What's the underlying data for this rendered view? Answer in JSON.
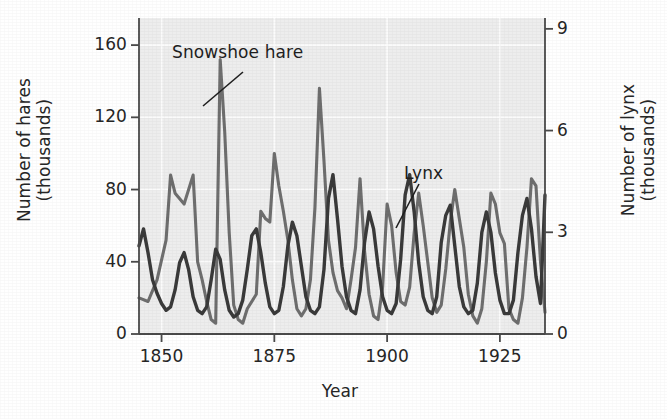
{
  "figure": {
    "background_color": "#ffffff",
    "plot_background_color": "#ededed"
  },
  "annotations": [
    {
      "name": "snowshoe-hare",
      "text": "Snowshoe hare"
    },
    {
      "name": "lynx",
      "text": "Lynx"
    }
  ],
  "annotation_labels": {
    "hare": "Snowshoe hare",
    "lynx": "Lynx"
  },
  "chart_data": {
    "type": "line",
    "title": "",
    "subtitle": "",
    "xlabel": "Year",
    "ylabel": "Number of hares\n(thousands)",
    "ylabel_right": "Number of lynx\n(thousands)",
    "xlim": [
      1845,
      1935
    ],
    "ylim": [
      0,
      175
    ],
    "ylim_right": [
      0,
      9.32
    ],
    "xticks": [
      1850,
      1875,
      1900,
      1925
    ],
    "xticklabels": [
      "1850",
      "1875",
      "1900",
      "1925"
    ],
    "yticks": [
      0,
      40,
      80,
      120,
      160
    ],
    "yticklabels": [
      "0",
      "40",
      "80",
      "120",
      "160"
    ],
    "yticks_right": [
      0,
      3,
      6,
      9
    ],
    "yticklabels_right": [
      "0",
      "3",
      "6",
      "9"
    ],
    "grid": true,
    "legend": "annotated-inline",
    "legend_position": "inline-callouts",
    "series": [
      {
        "name": "Snowshoe hare",
        "axis": "left",
        "units": "thousands of hares",
        "color": "#6e6e6e",
        "linewidth": 3.1,
        "x": [
          1845,
          1847,
          1849,
          1851,
          1852,
          1853,
          1855,
          1857,
          1858,
          1859,
          1860,
          1861,
          1862,
          1863,
          1864,
          1865,
          1866,
          1867,
          1868,
          1869,
          1871,
          1872,
          1873,
          1874,
          1875,
          1876,
          1877,
          1878,
          1879,
          1880,
          1881,
          1882,
          1883,
          1884,
          1885,
          1886,
          1887,
          1888,
          1889,
          1890,
          1891,
          1892,
          1893,
          1894,
          1895,
          1896,
          1897,
          1898,
          1899,
          1900,
          1901,
          1902,
          1903,
          1904,
          1905,
          1906,
          1907,
          1908,
          1909,
          1910,
          1911,
          1912,
          1913,
          1914,
          1915,
          1916,
          1917,
          1918,
          1919,
          1920,
          1921,
          1922,
          1923,
          1924,
          1925,
          1926,
          1927,
          1928,
          1929,
          1930,
          1931,
          1932,
          1933,
          1934,
          1935
        ],
        "y": [
          20,
          18,
          30,
          52,
          88,
          78,
          72,
          88,
          40,
          30,
          18,
          8,
          6,
          152,
          112,
          56,
          16,
          8,
          6,
          14,
          22,
          68,
          64,
          62,
          100,
          82,
          68,
          52,
          30,
          14,
          10,
          14,
          30,
          70,
          136,
          96,
          52,
          34,
          24,
          20,
          14,
          30,
          48,
          86,
          46,
          22,
          10,
          8,
          26,
          72,
          60,
          34,
          18,
          16,
          26,
          56,
          78,
          60,
          40,
          20,
          12,
          16,
          36,
          62,
          80,
          64,
          48,
          22,
          10,
          6,
          14,
          40,
          78,
          72,
          56,
          50,
          14,
          8,
          6,
          20,
          48,
          86,
          82,
          40,
          12
        ]
      },
      {
        "name": "Lynx",
        "axis": "right",
        "units": "thousands of lynx",
        "color": "#3a3a3a",
        "linewidth": 3.4,
        "x": [
          1845,
          1846,
          1847,
          1848,
          1849,
          1850,
          1851,
          1852,
          1853,
          1854,
          1855,
          1856,
          1857,
          1858,
          1859,
          1860,
          1861,
          1862,
          1863,
          1864,
          1865,
          1866,
          1867,
          1868,
          1869,
          1870,
          1871,
          1872,
          1873,
          1874,
          1875,
          1876,
          1877,
          1878,
          1879,
          1880,
          1881,
          1882,
          1883,
          1884,
          1885,
          1886,
          1887,
          1888,
          1889,
          1890,
          1891,
          1892,
          1893,
          1894,
          1895,
          1896,
          1897,
          1898,
          1899,
          1900,
          1901,
          1902,
          1903,
          1904,
          1905,
          1906,
          1907,
          1908,
          1909,
          1910,
          1911,
          1912,
          1913,
          1914,
          1915,
          1916,
          1917,
          1918,
          1919,
          1920,
          1921,
          1922,
          1923,
          1924,
          1925,
          1926,
          1927,
          1928,
          1929,
          1930,
          1931,
          1932,
          1933,
          1934,
          1935
        ],
        "y": [
          2.6,
          3.1,
          2.4,
          1.6,
          1.2,
          0.9,
          0.7,
          0.8,
          1.3,
          2.1,
          2.4,
          1.9,
          1.1,
          0.7,
          0.6,
          0.8,
          1.6,
          2.5,
          2.2,
          1.3,
          0.7,
          0.5,
          0.6,
          1.0,
          1.9,
          2.9,
          3.1,
          2.4,
          1.5,
          0.8,
          0.6,
          0.7,
          1.4,
          2.6,
          3.3,
          2.9,
          2.0,
          1.1,
          0.7,
          0.6,
          0.8,
          1.9,
          4.0,
          4.7,
          3.4,
          2.0,
          1.1,
          0.7,
          0.6,
          1.3,
          2.7,
          3.6,
          3.1,
          2.0,
          1.1,
          0.7,
          0.6,
          0.9,
          2.2,
          4.1,
          4.7,
          3.6,
          2.1,
          1.1,
          0.7,
          0.6,
          1.1,
          2.7,
          3.5,
          3.8,
          2.6,
          1.4,
          0.8,
          0.6,
          0.7,
          1.5,
          3.0,
          3.6,
          3.0,
          1.8,
          1.0,
          0.6,
          0.6,
          1.0,
          2.4,
          3.5,
          4.0,
          3.1,
          1.7,
          0.9,
          4.1
        ]
      }
    ]
  }
}
